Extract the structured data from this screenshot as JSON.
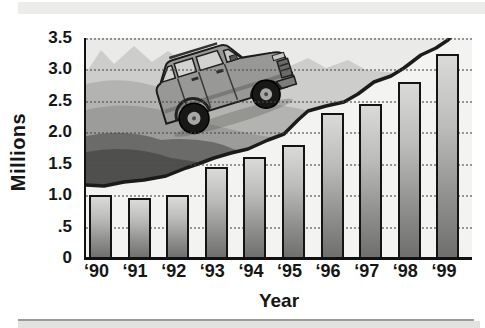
{
  "chart_data": {
    "type": "bar",
    "title": "",
    "categories": [
      "‘90",
      "‘91",
      "‘92",
      "‘93",
      "‘94",
      "‘95",
      "‘96",
      "‘97",
      "‘98",
      "‘99"
    ],
    "values": [
      1.0,
      0.95,
      1.0,
      1.45,
      1.6,
      1.8,
      2.3,
      2.45,
      2.8,
      3.25
    ],
    "xlabel": "Year",
    "ylabel": "Millions",
    "ylim": [
      0,
      3.5
    ],
    "ytick_values": [
      0,
      0.5,
      1.0,
      1.5,
      2.0,
      2.5,
      3.0,
      3.5
    ],
    "ytick_labels": [
      "0",
      ".5",
      "1.0",
      "1.5",
      "2.0",
      "2.5",
      "3.0",
      "3.5"
    ],
    "grid": "dotted-horizontal-every-0.5",
    "legend_position": "none",
    "illustration": "suv-climbing-mountain-ridge",
    "colors": {
      "bar_gradient_top": "#dadad8",
      "bar_gradient_bottom": "#6e6e6c",
      "bar_border": "#141414",
      "axis": "#111111",
      "plot_background": "#f1f1ef",
      "sky": "#eaeae8",
      "far_peaks": "#cdcdcb",
      "mid_mountain": "#b3b3b1",
      "mid_mountain_2": "#9c9c9a",
      "dark_mountain": "#6b6b69",
      "darkest_mountain": "#4f4f4d",
      "ridge_line": "#1b1b1b",
      "top_band": "#ececea",
      "bottom_band": "#e2e2e0"
    }
  }
}
